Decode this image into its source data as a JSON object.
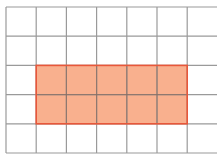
{
  "diagram": {
    "type": "grid-area-model",
    "grid": {
      "origin_x": 6,
      "origin_y": 7,
      "cell_size_x": 30.2,
      "cell_size_y": 29.2,
      "columns": 7,
      "rows": 5,
      "right_edge_open": true,
      "line_color": "#9a9a9a",
      "line_width": 1.2
    },
    "shaded_rectangle": {
      "col_start": 1,
      "row_start": 2,
      "width_cells": 5,
      "height_cells": 2,
      "fill_color": "#f9b08e",
      "border_color": "#e8573a",
      "inner_line_color": "#8a6a5c",
      "area_cells": 10
    },
    "colors": {
      "background": "#ffffff"
    }
  }
}
